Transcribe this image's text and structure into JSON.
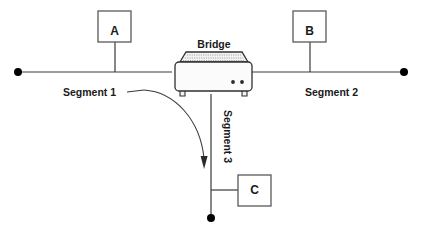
{
  "diagram": {
    "type": "network-bridge-topology",
    "background_color": "#ffffff",
    "line_color": "#3a3a3a",
    "text_color": "#1a1a1a",
    "nodes": [
      {
        "id": "a",
        "label": "A",
        "role": "station"
      },
      {
        "id": "b",
        "label": "B",
        "role": "station"
      },
      {
        "id": "c",
        "label": "C",
        "role": "station"
      }
    ],
    "device": {
      "label": "Bridge",
      "led_count": 2
    },
    "segments": [
      {
        "id": "seg1",
        "label": "Segment 1",
        "orientation": "horizontal"
      },
      {
        "id": "seg2",
        "label": "Segment 2",
        "orientation": "horizontal"
      },
      {
        "id": "seg3",
        "label": "Segment 3",
        "orientation": "vertical"
      }
    ],
    "annotation": {
      "pointer_from": "Segment 1",
      "pointer_to": "Segment 3"
    }
  }
}
